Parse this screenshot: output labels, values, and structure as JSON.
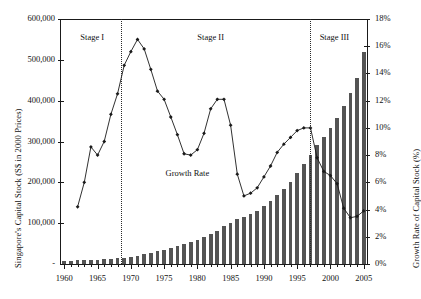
{
  "chart_data": {
    "type": "bar",
    "title": "",
    "xlabel": "",
    "ylabel": "Singapore's Capital Stock (S$ in 2000 Prices)",
    "y2label": "Growth Rate of Capital Stock (%)",
    "xlim": [
      1959.5,
      2005.5
    ],
    "ylim": [
      0,
      600000
    ],
    "y2lim": [
      0,
      18
    ],
    "grid": false,
    "legend": "none",
    "x_tick_labels": [
      "1960",
      "1965",
      "1970",
      "1975",
      "1980",
      "1985",
      "1990",
      "1995",
      "2000",
      "2005"
    ],
    "y_tick_labels": [
      "-",
      "100,000",
      "200,000",
      "300,000",
      "400,000",
      "500,000",
      "600,000"
    ],
    "y2_tick_labels": [
      "0%",
      "2%",
      "4%",
      "6%",
      "8%",
      "10%",
      "12%",
      "14%",
      "16%",
      "18%"
    ],
    "categories": [
      1960,
      1961,
      1962,
      1963,
      1964,
      1965,
      1966,
      1967,
      1968,
      1969,
      1970,
      1971,
      1972,
      1973,
      1974,
      1975,
      1976,
      1977,
      1978,
      1979,
      1980,
      1981,
      1982,
      1983,
      1984,
      1985,
      1986,
      1987,
      1988,
      1989,
      1990,
      1991,
      1992,
      1993,
      1994,
      1995,
      1996,
      1997,
      1998,
      1999,
      2000,
      2001,
      2002,
      2003,
      2004,
      2005
    ],
    "series": [
      {
        "name": "Singapore's Capital Stock",
        "type": "bar",
        "axis": "left",
        "color": "#545454",
        "values": [
          8000,
          8400,
          8800,
          9300,
          10000,
          10700,
          11500,
          12500,
          13800,
          15500,
          17800,
          20700,
          24000,
          27500,
          31200,
          35000,
          39000,
          43200,
          47800,
          53000,
          59000,
          65500,
          73000,
          82000,
          92000,
          101000,
          109000,
          115000,
          122000,
          131000,
          142000,
          154000,
          168000,
          184000,
          202000,
          222000,
          245000,
          268000,
          291000,
          312000,
          333000,
          357000,
          386000,
          418000,
          455000,
          520000
        ]
      },
      {
        "name": "Growth Rate",
        "type": "line",
        "axis": "right",
        "color": "#1a1a1a",
        "marker": "diamond",
        "values": [
          null,
          null,
          4.2,
          6.0,
          8.6,
          8.0,
          9.0,
          11.0,
          12.5,
          14.6,
          15.6,
          16.5,
          15.8,
          14.3,
          12.7,
          12.1,
          10.8,
          9.5,
          8.1,
          8.0,
          8.4,
          9.6,
          11.4,
          12.1,
          12.1,
          10.2,
          6.6,
          5.0,
          5.2,
          5.6,
          6.4,
          7.2,
          8.2,
          8.8,
          9.3,
          9.8,
          10.0,
          10.0,
          7.8,
          6.8,
          6.5,
          5.9,
          4.1,
          3.4,
          3.5,
          3.9
        ]
      }
    ],
    "annotations": [
      {
        "name": "growth-rate-label",
        "text": "Growth Rate",
        "x_year": 1978.5,
        "value_pct": 6.6
      },
      {
        "name": "stage-1-label",
        "text": "Stage I",
        "x_year": 1964.2,
        "value_pct": 16.6
      },
      {
        "name": "stage-2-label",
        "text": "Stage II",
        "x_year": 1982.0,
        "value_pct": 16.6
      },
      {
        "name": "stage-3-label",
        "text": "Stage III",
        "x_year": 2000.6,
        "value_pct": 16.6
      }
    ],
    "stage_dividers": [
      {
        "name": "divider-stage-1-2",
        "x_year": 1968.5
      },
      {
        "name": "divider-stage-2-3",
        "x_year": 1997.0
      }
    ]
  }
}
